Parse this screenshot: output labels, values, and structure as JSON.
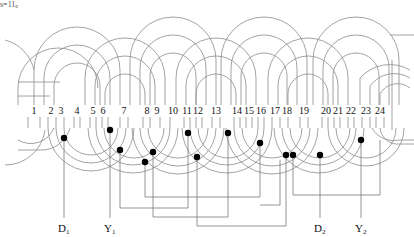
{
  "caption": "s=11。",
  "diagram": {
    "type": "stator-winding",
    "slot_count": 24,
    "slots": [
      {
        "n": "1",
        "x": 34
      },
      {
        "n": "2",
        "x": 51
      },
      {
        "n": "3",
        "x": 61
      },
      {
        "n": "4",
        "x": 77
      },
      {
        "n": "5",
        "x": 93
      },
      {
        "n": "6",
        "x": 103
      },
      {
        "n": "7",
        "x": 124
      },
      {
        "n": "8",
        "x": 147
      },
      {
        "n": "9",
        "x": 157
      },
      {
        "n": "10",
        "x": 173
      },
      {
        "n": "11",
        "x": 187
      },
      {
        "n": "12",
        "x": 197
      },
      {
        "n": "13",
        "x": 216
      },
      {
        "n": "14",
        "x": 237
      },
      {
        "n": "15",
        "x": 248
      },
      {
        "n": "16",
        "x": 260
      },
      {
        "n": "17",
        "x": 275
      },
      {
        "n": "18",
        "x": 287
      },
      {
        "n": "19",
        "x": 304
      },
      {
        "n": "20",
        "x": 326
      },
      {
        "n": "21",
        "x": 337
      },
      {
        "n": "22",
        "x": 351
      },
      {
        "n": "23",
        "x": 366
      },
      {
        "n": "24",
        "x": 380
      }
    ],
    "terminals": [
      {
        "id": "D1",
        "main": "D",
        "sub": "1",
        "x": 64
      },
      {
        "id": "Y1",
        "main": "Y",
        "sub": "1",
        "x": 110
      },
      {
        "id": "D2",
        "main": "D",
        "sub": "2",
        "x": 320
      },
      {
        "id": "Y2",
        "main": "Y",
        "sub": "2",
        "x": 361
      }
    ],
    "junctions": [
      {
        "x": 64,
        "y": 138
      },
      {
        "x": 110,
        "y": 130
      },
      {
        "x": 120,
        "y": 150
      },
      {
        "x": 153,
        "y": 152
      },
      {
        "x": 145,
        "y": 162
      },
      {
        "x": 188,
        "y": 133
      },
      {
        "x": 197,
        "y": 157
      },
      {
        "x": 228,
        "y": 133
      },
      {
        "x": 260,
        "y": 143
      },
      {
        "x": 286,
        "y": 155
      },
      {
        "x": 293,
        "y": 155
      },
      {
        "x": 320,
        "y": 155
      },
      {
        "x": 361,
        "y": 140
      }
    ]
  }
}
